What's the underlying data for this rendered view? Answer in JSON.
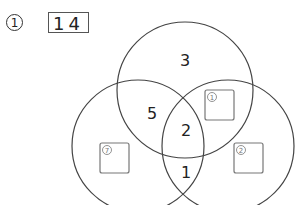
{
  "problem": {
    "number_label": "1",
    "answer": "14"
  },
  "venn": {
    "circles": [
      {
        "name": "top",
        "cx": 185,
        "cy": 90,
        "r": 68
      },
      {
        "name": "left",
        "cx": 138,
        "cy": 146,
        "r": 66
      },
      {
        "name": "right",
        "cx": 228,
        "cy": 146,
        "r": 66
      }
    ],
    "stroke_color": "#444444",
    "regions": [
      {
        "name": "top-only",
        "value": "3",
        "x": 185,
        "y": 60
      },
      {
        "name": "top-left",
        "value": "5",
        "x": 152,
        "y": 113
      },
      {
        "name": "center",
        "value": "2",
        "x": 186,
        "y": 130
      },
      {
        "name": "left-right",
        "value": "1",
        "x": 186,
        "y": 172
      }
    ],
    "blank_slots": [
      {
        "name": "top-right-slot",
        "x": 205,
        "y": 90,
        "w": 29,
        "h": 30,
        "marker": "1"
      },
      {
        "name": "left-only-slot",
        "x": 100,
        "y": 143,
        "w": 29,
        "h": 30,
        "marker": "7"
      },
      {
        "name": "right-only-slot",
        "x": 234,
        "y": 143,
        "w": 29,
        "h": 30,
        "marker": "2"
      }
    ],
    "slot_color": "#777777"
  }
}
